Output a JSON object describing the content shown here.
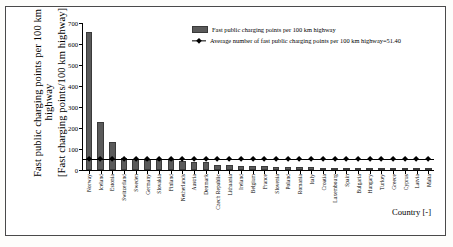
{
  "chart_data": {
    "type": "bar",
    "title": "",
    "xlabel": "Country [-]",
    "ylabel_line1": "Fast public charging points per 100 km",
    "ylabel_line1b": "highway",
    "ylabel_line2": "[Fast charging points/100 km highway]",
    "ylim": [
      0,
      700
    ],
    "yticks": [
      0,
      100,
      200,
      300,
      400,
      500,
      600,
      700
    ],
    "grid": false,
    "legend_position": "top-right",
    "categories": [
      "Norway",
      "Iceland",
      "Estonia",
      "Switzerland",
      "Sweden",
      "Germany",
      "Slovakia",
      "Finland",
      "Netherlands",
      "Austria",
      "Denmark",
      "Czech Republic",
      "Lithuania",
      "Ireland",
      "Belgium",
      "France",
      "Slovenia",
      "Poland",
      "Romania",
      "Italy",
      "Croatia",
      "Luxembourg",
      "Spain",
      "Bulgaria",
      "Hungary",
      "Turkey",
      "Greece",
      "Cyprus",
      "Latvia",
      "Malta"
    ],
    "series": [
      {
        "name": "Fast public charging points per 100 km highway",
        "type": "bar",
        "color": "#5a5a5a",
        "values": [
          655,
          228,
          132,
          57,
          52,
          50,
          48,
          47,
          44,
          38,
          36,
          25,
          22,
          20,
          19,
          17,
          16,
          15,
          13,
          12,
          9,
          8,
          7,
          5,
          4,
          3,
          2,
          2,
          1,
          1
        ]
      },
      {
        "name": "Average number of fast public charging points per 100 km highway=51.40",
        "type": "line",
        "color": "#000000",
        "marker": "diamond",
        "value": 51.4,
        "values": [
          51.4,
          51.4,
          51.4,
          51.4,
          51.4,
          51.4,
          51.4,
          51.4,
          51.4,
          51.4,
          51.4,
          51.4,
          51.4,
          51.4,
          51.4,
          51.4,
          51.4,
          51.4,
          51.4,
          51.4,
          51.4,
          51.4,
          51.4,
          51.4,
          51.4,
          51.4,
          51.4,
          51.4,
          51.4,
          51.4
        ]
      }
    ]
  },
  "legend": {
    "bar_label": "Fast public charging points per 100 km highway",
    "line_label": "Average number of fast public charging points per 100 km highway=51.40"
  },
  "axes": {
    "x_title": "Country [-]"
  }
}
